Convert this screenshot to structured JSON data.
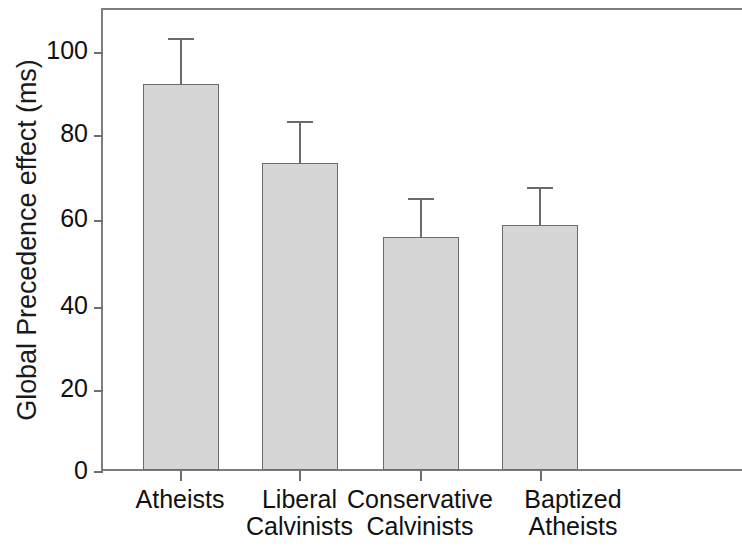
{
  "chart_data": {
    "type": "bar",
    "title": "",
    "subtitle": "",
    "xlabel": "",
    "ylabel": "Global Precedence effect (ms)",
    "categories": [
      "Atheists",
      "Liberal Calvinists",
      "Conservative Calvinists",
      "Baptized Atheists"
    ],
    "category_lines": [
      [
        "Atheists"
      ],
      [
        "Liberal",
        "Calvinists"
      ],
      [
        "Conservative",
        "Calvinists"
      ],
      [
        "Baptized",
        "Atheists"
      ]
    ],
    "values": [
      93,
      74,
      56,
      59
    ],
    "errors_upper": [
      11,
      10,
      9.5,
      9
    ],
    "error_bar_tops": [
      104,
      84,
      65.5,
      68
    ],
    "ylim": [
      0,
      111
    ],
    "yticks": [
      0,
      20,
      40,
      60,
      80,
      100
    ],
    "ytick_labels": [
      "0",
      "20",
      "40",
      "60",
      "80",
      "100"
    ],
    "grid": false,
    "legend": null,
    "bar_fill_color": "#d6d6d6",
    "bar_edge_color": "#6b6b6b",
    "axis_color": "#7d7d7d",
    "error_bar_direction": "upper-only"
  }
}
